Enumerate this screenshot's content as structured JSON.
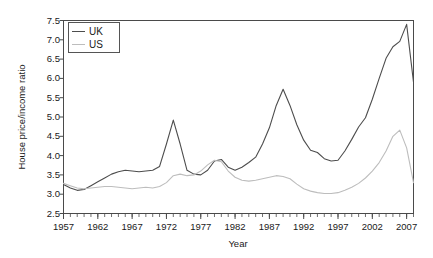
{
  "chart_data": {
    "type": "line",
    "title": "",
    "xlabel": "Year",
    "ylabel": "House price/income ratio",
    "xlim": [
      1957,
      2008
    ],
    "ylim": [
      2.5,
      7.5
    ],
    "ytick_step": 0.5,
    "xtick_step_major": 5,
    "xtick_step_minor": 1,
    "grid": false,
    "legend_position": "top-left",
    "x": [
      1957,
      1958,
      1959,
      1960,
      1961,
      1962,
      1963,
      1964,
      1965,
      1966,
      1967,
      1968,
      1969,
      1970,
      1971,
      1972,
      1973,
      1974,
      1975,
      1976,
      1977,
      1978,
      1979,
      1980,
      1981,
      1982,
      1983,
      1984,
      1985,
      1986,
      1987,
      1988,
      1989,
      1990,
      1991,
      1992,
      1993,
      1994,
      1995,
      1996,
      1997,
      1998,
      1999,
      2000,
      2001,
      2002,
      2003,
      2004,
      2005,
      2006,
      2007,
      2008
    ],
    "yticks": [
      2.5,
      3.0,
      3.5,
      4.0,
      4.5,
      5.0,
      5.5,
      6.0,
      6.5,
      7.0,
      7.5
    ],
    "xticks_major": [
      1957,
      1962,
      1967,
      1972,
      1977,
      1982,
      1987,
      1992,
      1997,
      2002,
      2007
    ],
    "series": [
      {
        "name": "UK",
        "color": "#4d4d4d",
        "values": [
          3.25,
          3.16,
          3.1,
          3.12,
          3.22,
          3.32,
          3.42,
          3.52,
          3.58,
          3.62,
          3.6,
          3.58,
          3.6,
          3.62,
          3.72,
          4.3,
          4.92,
          4.3,
          3.62,
          3.52,
          3.5,
          3.62,
          3.86,
          3.9,
          3.7,
          3.62,
          3.7,
          3.82,
          3.96,
          4.3,
          4.72,
          5.3,
          5.72,
          5.3,
          4.8,
          4.4,
          4.14,
          4.08,
          3.92,
          3.86,
          3.88,
          4.12,
          4.42,
          4.74,
          4.98,
          5.46,
          6.0,
          6.52,
          6.82,
          6.96,
          7.4,
          5.9
        ]
      },
      {
        "name": "US",
        "color": "#bdbdbd",
        "values": [
          3.28,
          3.22,
          3.16,
          3.14,
          3.16,
          3.18,
          3.2,
          3.2,
          3.18,
          3.16,
          3.14,
          3.16,
          3.18,
          3.16,
          3.2,
          3.3,
          3.48,
          3.52,
          3.48,
          3.5,
          3.6,
          3.76,
          3.88,
          3.84,
          3.6,
          3.44,
          3.36,
          3.34,
          3.36,
          3.4,
          3.44,
          3.48,
          3.46,
          3.4,
          3.26,
          3.14,
          3.08,
          3.04,
          3.02,
          3.02,
          3.04,
          3.1,
          3.18,
          3.28,
          3.42,
          3.6,
          3.82,
          4.12,
          4.5,
          4.66,
          4.2,
          3.3
        ]
      }
    ]
  },
  "legend": {
    "entries": [
      {
        "label": "UK"
      },
      {
        "label": "US"
      }
    ]
  },
  "axis": {
    "y_title": "House price/income ratio",
    "x_title": "Year"
  }
}
